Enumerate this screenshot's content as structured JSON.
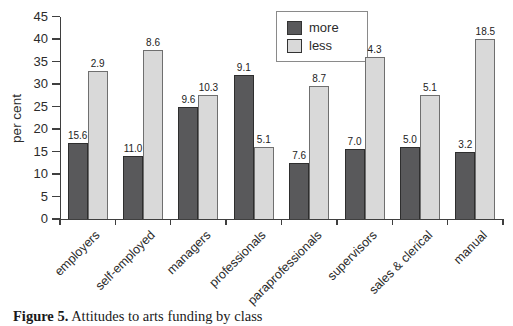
{
  "figure": {
    "caption_prefix": "Figure 5.",
    "caption_text": " Attitudes to arts funding by class"
  },
  "chart_data": {
    "type": "bar",
    "title": "",
    "xlabel": "",
    "ylabel": "per cent",
    "ylim": [
      0,
      45
    ],
    "ytick_step": 5,
    "ytick_labels": [
      "0",
      "5",
      "10",
      "15",
      "20",
      "25",
      "30",
      "35",
      "40",
      "45"
    ],
    "grid": false,
    "legend": {
      "position": "top-center",
      "entries": [
        "more",
        "less"
      ]
    },
    "categories": [
      "employers",
      "self-employed",
      "managers",
      "professionals",
      "paraprofessionals",
      "supervisors",
      "sales & clerical",
      "manual"
    ],
    "series": [
      {
        "name": "more",
        "color": "#59595b",
        "border_color": "#2e2e2e",
        "values": [
          17,
          14,
          25,
          32,
          12.5,
          15.5,
          16,
          15
        ],
        "bar_labels": [
          "15.6",
          "11.0",
          "9.6",
          "9.1",
          "7.6",
          "7.0",
          "5.0",
          "3.2"
        ]
      },
      {
        "name": "less",
        "color": "#d9d9d9",
        "border_color": "#6f6f6f",
        "values": [
          33,
          37.5,
          27.5,
          16,
          29.5,
          36,
          27.5,
          40
        ],
        "bar_labels": [
          "2.9",
          "8.6",
          "10.3",
          "5.1",
          "8.7",
          "4.3",
          "5.1",
          "18.5"
        ]
      }
    ]
  },
  "colors": {
    "axis": "#3f3f3f",
    "background": "#ffffff",
    "bar_more": "#59595b",
    "bar_less": "#d9d9d9"
  }
}
